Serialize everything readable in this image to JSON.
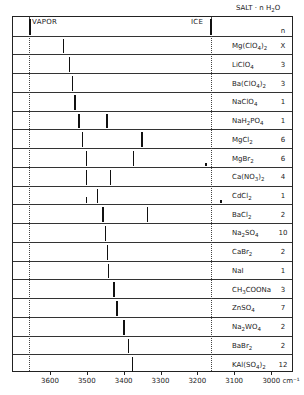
{
  "chart_data": {
    "type": "bar",
    "title": "SALT · n H2O",
    "xlabel": "cm-1",
    "x_axis": {
      "ticks": [
        3600,
        3500,
        3400,
        3300,
        3200,
        3100,
        3000
      ],
      "range": [
        3700,
        2950
      ],
      "reversed": true,
      "unit_label": "cm-1"
    },
    "reference_lines": [
      {
        "name": "VAPOR",
        "x": 3657
      },
      {
        "name": "ICE",
        "x": 3163
      }
    ],
    "header": {
      "salt_col": "SALT · n H2O",
      "n_col": "n"
    },
    "rows": [
      {
        "salt": "Mg(ClO4)2",
        "n": "X",
        "peaks": [
          3565
        ]
      },
      {
        "salt": "LiClO4",
        "n": "3",
        "peaks": [
          3549
        ]
      },
      {
        "salt": "Ba(ClO4)2",
        "n": "3",
        "peaks": [
          3541
        ]
      },
      {
        "salt": "NaClO4",
        "n": "1",
        "peaks": [
          3535
        ]
      },
      {
        "salt": "NaH2PO4",
        "n": "1",
        "peaks": [
          3524,
          3448
        ]
      },
      {
        "salt": "MgCl2",
        "n": "6",
        "peaks": [
          3514,
          3353
        ]
      },
      {
        "salt": "MgBr2",
        "n": "6",
        "peaks": [
          3503,
          3375
        ],
        "minor_peaks": [
          3179
        ]
      },
      {
        "salt": "Ca(NO3)2",
        "n": "4",
        "peaks": [
          3503,
          3438
        ]
      },
      {
        "salt": "CdCl2",
        "n": "1",
        "peaks": [
          3473
        ],
        "minor_peaks": [
          3503,
          3138
        ]
      },
      {
        "salt": "BaCl2",
        "n": "2",
        "peaks": [
          3459,
          3337
        ]
      },
      {
        "salt": "Na2SO4",
        "n": "10",
        "peaks": [
          3451
        ]
      },
      {
        "salt": "CaBr2",
        "n": "2",
        "peaks": [
          3446
        ]
      },
      {
        "salt": "NaI",
        "n": "1",
        "peaks": [
          3443
        ]
      },
      {
        "salt": "CH3COONa",
        "n": "3",
        "peaks": [
          3429
        ]
      },
      {
        "salt": "ZnSO4",
        "n": "7",
        "peaks": [
          3421
        ]
      },
      {
        "salt": "Na2WO4",
        "n": "2",
        "peaks": [
          3402
        ]
      },
      {
        "salt": "BaBr2",
        "n": "2",
        "peaks": [
          3389
        ]
      },
      {
        "salt": "KAl(SO4)2",
        "n": "12",
        "peaks": [
          3378
        ]
      }
    ],
    "grid": false,
    "legend": "none"
  },
  "labels": {
    "title_html_parts": [
      "SALT · n H",
      "2",
      "O"
    ],
    "vapor": "VAPOR",
    "ice": "ICE",
    "n_header": "n",
    "tick_labels": [
      "3600",
      "3500",
      "3400",
      "3300",
      "3200",
      "3100",
      "3000 cm⁻¹"
    ]
  },
  "salt_display": [
    [
      "Mg(ClO",
      "4",
      ")",
      "2"
    ],
    [
      "LiClO",
      "4"
    ],
    [
      "Ba(ClO",
      "4",
      ")",
      "2"
    ],
    [
      "NaClO",
      "4"
    ],
    [
      "NaH",
      "2",
      "PO",
      "4"
    ],
    [
      "MgCl",
      "2"
    ],
    [
      "MgBr",
      "2"
    ],
    [
      "Ca(NO",
      "3",
      ")",
      "2"
    ],
    [
      "CdCl",
      "2"
    ],
    [
      "BaCl",
      "2"
    ],
    [
      "Na",
      "2",
      "SO",
      "4"
    ],
    [
      "CaBr",
      "2"
    ],
    [
      "NaI"
    ],
    [
      "CH",
      "3",
      "COONa"
    ],
    [
      "ZnSO",
      "4"
    ],
    [
      "Na",
      "2",
      "WO",
      "4"
    ],
    [
      "BaBr",
      "2"
    ],
    [
      "KAl(SO",
      "4",
      ")",
      "2"
    ]
  ]
}
